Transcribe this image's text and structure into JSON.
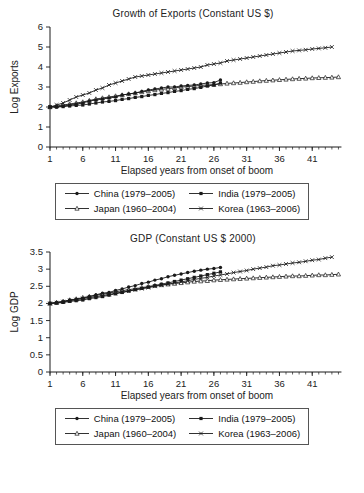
{
  "page": {
    "background": "#ffffff",
    "ink": "#1a1a1a"
  },
  "legend": {
    "entries": [
      {
        "label": "China (1979–2005)",
        "marker": "filled-circle"
      },
      {
        "label": "India (1979–2005)",
        "marker": "filled-square"
      },
      {
        "label": "Japan (1960–2004)",
        "marker": "open-triangle"
      },
      {
        "label": "Korea (1963–2006)",
        "marker": "cross"
      }
    ]
  },
  "chart_data": [
    {
      "type": "line",
      "title": "Growth of Exports (Constant US $)",
      "xlabel": "Elapsed years from onset of boom",
      "ylabel": "Log Exports",
      "xlim": [
        1,
        46
      ],
      "ylim": [
        0,
        6
      ],
      "xticks": [
        1,
        6,
        11,
        16,
        21,
        26,
        31,
        36,
        41
      ],
      "yticks": [
        0,
        1,
        2,
        3,
        4,
        5,
        6
      ],
      "minor_ticks_every_year": true,
      "legend_position": "bottom",
      "grid": false,
      "series": [
        {
          "name": "Japan (1960–2004)",
          "marker": "open-triangle",
          "x_start": 1,
          "values": [
            2.0,
            2.05,
            2.1,
            2.15,
            2.2,
            2.25,
            2.32,
            2.4,
            2.45,
            2.5,
            2.55,
            2.6,
            2.65,
            2.7,
            2.75,
            2.8,
            2.85,
            2.88,
            2.92,
            2.95,
            3.0,
            3.02,
            3.05,
            3.08,
            3.1,
            3.12,
            3.15,
            3.18,
            3.2,
            3.22,
            3.25,
            3.27,
            3.3,
            3.32,
            3.34,
            3.36,
            3.38,
            3.4,
            3.42,
            3.43,
            3.45,
            3.46,
            3.47,
            3.48,
            3.5
          ]
        },
        {
          "name": "Korea (1963–2006)",
          "marker": "cross",
          "x_start": 1,
          "values": [
            2.0,
            2.1,
            2.2,
            2.35,
            2.5,
            2.6,
            2.7,
            2.85,
            2.95,
            3.1,
            3.2,
            3.3,
            3.4,
            3.5,
            3.55,
            3.6,
            3.65,
            3.7,
            3.75,
            3.8,
            3.85,
            3.9,
            3.95,
            4.0,
            4.1,
            4.15,
            4.2,
            4.3,
            4.35,
            4.4,
            4.45,
            4.5,
            4.55,
            4.6,
            4.65,
            4.7,
            4.75,
            4.8,
            4.83,
            4.86,
            4.9,
            4.93,
            4.96,
            5.0
          ]
        },
        {
          "name": "India (1979–2005)",
          "marker": "filled-square",
          "x_start": 1,
          "values": [
            2.0,
            2.0,
            2.02,
            2.05,
            2.08,
            2.1,
            2.15,
            2.2,
            2.25,
            2.28,
            2.32,
            2.38,
            2.42,
            2.48,
            2.52,
            2.58,
            2.62,
            2.68,
            2.72,
            2.78,
            2.82,
            2.88,
            2.92,
            2.98,
            3.05,
            3.1,
            3.2
          ]
        },
        {
          "name": "China (1979–2005)",
          "marker": "filled-circle",
          "x_start": 1,
          "values": [
            2.0,
            2.0,
            2.05,
            2.1,
            2.15,
            2.2,
            2.3,
            2.35,
            2.4,
            2.45,
            2.5,
            2.6,
            2.65,
            2.7,
            2.78,
            2.85,
            2.9,
            2.95,
            3.0,
            3.0,
            3.05,
            3.08,
            3.1,
            3.15,
            3.2,
            3.22,
            3.35
          ]
        }
      ]
    },
    {
      "type": "line",
      "title": "GDP (Constant US $ 2000)",
      "xlabel": "Elapsed years from onset of boom",
      "ylabel": "Log GDP",
      "xlim": [
        1,
        46
      ],
      "ylim": [
        0,
        3.5
      ],
      "xticks": [
        1,
        6,
        11,
        16,
        21,
        26,
        31,
        36,
        41
      ],
      "yticks": [
        0,
        0.5,
        1,
        1.5,
        2,
        2.5,
        3,
        3.5
      ],
      "minor_ticks_every_year": true,
      "legend_position": "bottom",
      "grid": false,
      "series": [
        {
          "name": "Japan (1960–2004)",
          "marker": "open-triangle",
          "x_start": 1,
          "values": [
            2.0,
            2.03,
            2.06,
            2.1,
            2.13,
            2.17,
            2.2,
            2.24,
            2.27,
            2.3,
            2.34,
            2.37,
            2.4,
            2.43,
            2.46,
            2.49,
            2.52,
            2.54,
            2.56,
            2.58,
            2.6,
            2.62,
            2.64,
            2.65,
            2.66,
            2.68,
            2.69,
            2.7,
            2.71,
            2.72,
            2.73,
            2.74,
            2.75,
            2.76,
            2.77,
            2.78,
            2.79,
            2.8,
            2.8,
            2.81,
            2.82,
            2.83,
            2.83,
            2.84,
            2.85
          ]
        },
        {
          "name": "Korea (1963–2006)",
          "marker": "cross",
          "x_start": 1,
          "values": [
            2.0,
            2.02,
            2.05,
            2.08,
            2.11,
            2.14,
            2.17,
            2.2,
            2.23,
            2.26,
            2.3,
            2.33,
            2.36,
            2.4,
            2.43,
            2.46,
            2.5,
            2.53,
            2.56,
            2.6,
            2.63,
            2.66,
            2.7,
            2.73,
            2.76,
            2.8,
            2.83,
            2.86,
            2.9,
            2.93,
            2.96,
            3.0,
            3.03,
            3.06,
            3.1,
            3.12,
            3.15,
            3.18,
            3.2,
            3.23,
            3.26,
            3.28,
            3.32,
            3.35
          ]
        },
        {
          "name": "India (1979–2005)",
          "marker": "filled-square",
          "x_start": 1,
          "values": [
            2.0,
            2.01,
            2.03,
            2.06,
            2.08,
            2.1,
            2.14,
            2.17,
            2.2,
            2.24,
            2.28,
            2.32,
            2.36,
            2.4,
            2.44,
            2.48,
            2.52,
            2.56,
            2.6,
            2.64,
            2.68,
            2.72,
            2.76,
            2.8,
            2.84,
            2.88,
            2.92
          ]
        },
        {
          "name": "China (1979–2005)",
          "marker": "filled-circle",
          "x_start": 1,
          "values": [
            2.0,
            2.02,
            2.05,
            2.1,
            2.12,
            2.15,
            2.2,
            2.25,
            2.3,
            2.32,
            2.38,
            2.42,
            2.48,
            2.52,
            2.58,
            2.62,
            2.68,
            2.72,
            2.78,
            2.82,
            2.86,
            2.9,
            2.94,
            2.97,
            3.0,
            3.02,
            3.05
          ]
        }
      ]
    }
  ]
}
